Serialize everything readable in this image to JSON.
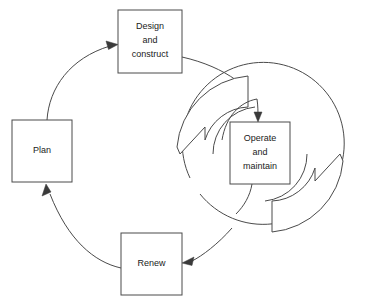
{
  "diagram": {
    "type": "cycle-diagram",
    "background_color": "#ffffff",
    "line_color": "#4a4a4a",
    "text_color": "#1a1a1a",
    "nodes": [
      {
        "id": "design-construct",
        "lines": [
          "Design",
          "and",
          "construct"
        ],
        "x": 118,
        "y": 10,
        "width": 64,
        "height": 63
      },
      {
        "id": "plan",
        "lines": [
          "Plan"
        ],
        "x": 12,
        "y": 120,
        "width": 60,
        "height": 62
      },
      {
        "id": "renew",
        "lines": [
          "Renew"
        ],
        "x": 121,
        "y": 233,
        "width": 61,
        "height": 62
      },
      {
        "id": "operate-maintain",
        "lines": [
          "Operate",
          "and",
          "maintain"
        ],
        "x": 230,
        "y": 122,
        "width": 60,
        "height": 62
      }
    ],
    "connectors": [
      {
        "id": "plan-to-design",
        "from": "plan",
        "to": "design-construct"
      },
      {
        "id": "design-to-operate",
        "from": "design-construct",
        "to": "operate-maintain"
      },
      {
        "id": "operate-to-renew",
        "from": "operate-maintain",
        "to": "renew"
      },
      {
        "id": "renew-to-plan",
        "from": "renew",
        "to": "plan"
      },
      {
        "id": "operate-inner-loop",
        "from": "operate-maintain",
        "to": "operate-maintain"
      }
    ],
    "recycle_symbol": {
      "id": "operate-recycle-arrows",
      "center_x": 260,
      "center_y": 154,
      "outer_radius": 81,
      "inner_radius": 47,
      "arrow_count": 2
    }
  }
}
